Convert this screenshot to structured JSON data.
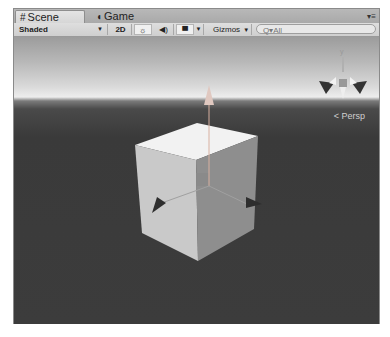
{
  "tabs": [
    {
      "label": "Scene",
      "icon": "scene-grid-icon",
      "active": true
    },
    {
      "label": "Game",
      "icon": "game-pacman-icon",
      "active": false
    }
  ],
  "toolbar": {
    "shading_mode": "Shaded",
    "mode_2d_label": "2D",
    "lighting_icon": "sun-icon",
    "audio_icon": "speaker-icon",
    "effects_icon": "image-icon",
    "gizmos_label": "Gizmos",
    "search_placeholder": "Q▾All"
  },
  "viewport": {
    "projection_label": "Persp",
    "orientation_gizmo_axis": "y",
    "selected_object": "Cube"
  }
}
